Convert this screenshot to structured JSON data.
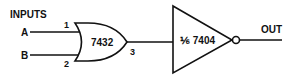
{
  "diagram": {
    "inputs_label": "INPUTS",
    "input_a": "A",
    "input_b": "B",
    "or_gate": {
      "part": "7432",
      "pin_in_1": "1",
      "pin_in_2": "2",
      "pin_out": "3"
    },
    "inverter": {
      "part": "⅙ 7404"
    },
    "output_label": "OUT",
    "colors": {
      "line": "#111111",
      "background": "#ffffff"
    }
  }
}
